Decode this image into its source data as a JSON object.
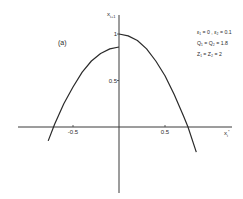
{
  "chart_data": {
    "type": "line",
    "title": "",
    "panel_label": "(a)",
    "xlabel": "x_i*",
    "ylabel": "x_{i+1}",
    "xlim": [
      -1.1,
      1.25
    ],
    "ylim": [
      -0.7,
      1.2
    ],
    "x_ticks": [
      {
        "value": -0.5,
        "label": "-0.5"
      },
      {
        "value": 0.5,
        "label": "0.5"
      }
    ],
    "y_ticks": [
      {
        "value": 1.0,
        "label": "1"
      },
      {
        "value": 0.5,
        "label": "0.5"
      }
    ],
    "grid": false,
    "annotations": [
      "ε₁ = 0 , ε₂ = 0.1",
      "Q₁ = Q₂ = 1.8",
      "Z₁ = Z₂ = 2"
    ],
    "series": [
      {
        "name": "left-branch",
        "x": [
          -0.77,
          -0.7,
          -0.6,
          -0.5,
          -0.4,
          -0.3,
          -0.2,
          -0.1,
          0.0
        ],
        "y": [
          -0.15,
          0.03,
          0.25,
          0.43,
          0.59,
          0.71,
          0.79,
          0.84,
          0.86
        ]
      },
      {
        "name": "right-branch",
        "x": [
          0.0,
          0.1,
          0.2,
          0.3,
          0.4,
          0.5,
          0.6,
          0.7,
          0.75,
          0.84
        ],
        "y": [
          1.0,
          0.98,
          0.93,
          0.84,
          0.71,
          0.55,
          0.35,
          0.12,
          0.0,
          -0.27
        ]
      }
    ]
  }
}
